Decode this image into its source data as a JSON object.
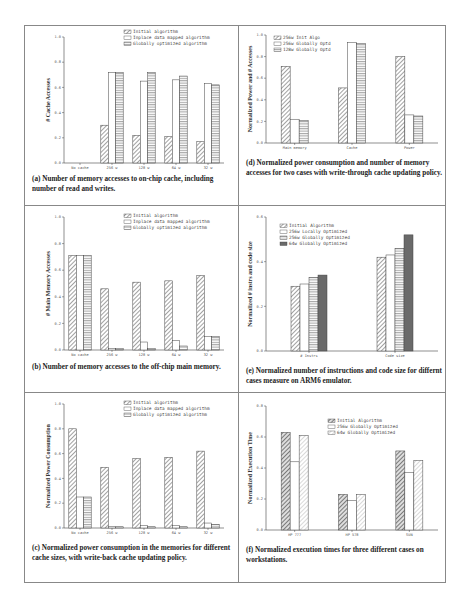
{
  "chart_data": [
    {
      "id": "a",
      "type": "bar",
      "caption_label": "(a)",
      "caption": "Number of memory accesses to on-chip cache, including number of read and writes.",
      "ylabel": "# Cache Accesses",
      "categories": [
        "No cache",
        "256 w",
        "128 w",
        "64 w",
        "32 w"
      ],
      "ylim": [
        0,
        1.0
      ],
      "yticks": [
        "0.0",
        "0.2",
        "0.4",
        "0.6",
        "0.8",
        "1.0"
      ],
      "legend_position": "top-right",
      "series": [
        {
          "name": "Initial algorithm",
          "pattern": "diag",
          "values": [
            0.0,
            0.3,
            0.22,
            0.21,
            0.17
          ]
        },
        {
          "name": "Inplace data mapped algorithm",
          "pattern": "white",
          "values": [
            0.0,
            0.72,
            0.65,
            0.66,
            0.63
          ]
        },
        {
          "name": "Globally optimized algorithm",
          "pattern": "horiz",
          "values": [
            0.0,
            0.72,
            0.72,
            0.69,
            0.62
          ]
        }
      ]
    },
    {
      "id": "b",
      "type": "bar",
      "caption_label": "(b)",
      "caption": "Number of memory accesses to the off-chip main memory.",
      "ylabel": "# Main Memory Accesses",
      "categories": [
        "No cache",
        "256 w",
        "128 w",
        "64 w",
        "32 w"
      ],
      "ylim": [
        0,
        1.0
      ],
      "yticks": [
        "0.0",
        "0.2",
        "0.4",
        "0.6",
        "0.8",
        "1.0"
      ],
      "legend_position": "top-right",
      "series": [
        {
          "name": "Initial algorithm",
          "pattern": "diag",
          "values": [
            0.71,
            0.46,
            0.51,
            0.52,
            0.56
          ]
        },
        {
          "name": "Inplace data mapped algorithm",
          "pattern": "white",
          "values": [
            0.71,
            0.01,
            0.06,
            0.07,
            0.1
          ]
        },
        {
          "name": "Globally optimized algorithm",
          "pattern": "horiz",
          "values": [
            0.71,
            0.01,
            0.01,
            0.03,
            0.1
          ]
        }
      ]
    },
    {
      "id": "c",
      "type": "bar",
      "caption_label": "(c)",
      "caption": "Normalized power consumption in the memories for different cache sizes, with write-back cache updating policy.",
      "ylabel": "Normalized Power Consumption",
      "categories": [
        "No cache",
        "256 w",
        "128 w",
        "64 w",
        "32 w"
      ],
      "ylim": [
        0,
        1.0
      ],
      "yticks": [
        "0.0",
        "0.2",
        "0.4",
        "0.6",
        "0.8",
        "1.0"
      ],
      "legend_position": "top-right",
      "series": [
        {
          "name": "Initial algorithm",
          "pattern": "diag",
          "values": [
            0.8,
            0.49,
            0.56,
            0.57,
            0.62
          ]
        },
        {
          "name": "Inplace data mapped algorithm",
          "pattern": "white",
          "values": [
            0.25,
            0.01,
            0.02,
            0.02,
            0.04
          ]
        },
        {
          "name": "Globally optimized algorithm",
          "pattern": "horiz",
          "values": [
            0.25,
            0.01,
            0.01,
            0.01,
            0.03
          ]
        }
      ]
    },
    {
      "id": "d",
      "type": "bar",
      "caption_label": "(d)",
      "caption": "Normalized power consumption and number of memory accesses for two cases with write-through cache updating policy.",
      "ylabel": "Normalized Power and # Accesses",
      "categories": [
        "Main memory",
        "Cache",
        "Power"
      ],
      "ylim": [
        0,
        1.0
      ],
      "yticks": [
        "0.0",
        "0.2",
        "0.4",
        "0.6",
        "0.8",
        "1.0"
      ],
      "legend_position": "top-left",
      "series": [
        {
          "name": "256w Init Algo",
          "pattern": "diag",
          "values": [
            0.71,
            0.51,
            0.8
          ]
        },
        {
          "name": "256w Globally Optd",
          "pattern": "white",
          "values": [
            0.22,
            0.93,
            0.26
          ]
        },
        {
          "name": "128w Globally Optd",
          "pattern": "horiz",
          "values": [
            0.21,
            0.92,
            0.25
          ]
        }
      ]
    },
    {
      "id": "e",
      "type": "bar",
      "caption_label": "(e)",
      "caption": "Normalized number of instructions and code size for differnt cases measure on ARM6 emulator.",
      "ylabel": "Normalized # instrs and code size",
      "categories": [
        "# Instrs",
        "Code size"
      ],
      "ylim": [
        0,
        0.6
      ],
      "yticks": [
        "0.0",
        "0.2",
        "0.4",
        "0.6"
      ],
      "legend_position": "top-left",
      "series": [
        {
          "name": "Initial Algorithm",
          "pattern": "diag",
          "values": [
            0.29,
            0.42
          ]
        },
        {
          "name": "256w Locally Optimized",
          "pattern": "white",
          "values": [
            0.3,
            0.43
          ]
        },
        {
          "name": "256w Globally Optimized",
          "pattern": "horiz",
          "values": [
            0.33,
            0.46
          ]
        },
        {
          "name": "64w Globally Optimized",
          "pattern": "dark",
          "values": [
            0.34,
            0.52
          ]
        }
      ]
    },
    {
      "id": "f",
      "type": "bar",
      "caption_label": "(f)",
      "caption": "Normalized execution times for three different cases on workstations.",
      "ylabel": "Normalized Execution Time",
      "categories": [
        "HP 777",
        "HP 578",
        "SUN"
      ],
      "ylim": [
        0,
        0.8
      ],
      "yticks": [
        "0.0",
        "0.2",
        "0.4",
        "0.6",
        "0.8"
      ],
      "legend_position": "top-right",
      "series": [
        {
          "name": "Initial Algorithm",
          "pattern": "diag-dark",
          "values": [
            0.63,
            0.23,
            0.51
          ]
        },
        {
          "name": "256w Globally Optimized",
          "pattern": "white",
          "values": [
            0.44,
            0.19,
            0.37
          ]
        },
        {
          "name": "64w Globally Optimized",
          "pattern": "diag-light",
          "values": [
            0.61,
            0.23,
            0.45
          ]
        }
      ]
    }
  ]
}
